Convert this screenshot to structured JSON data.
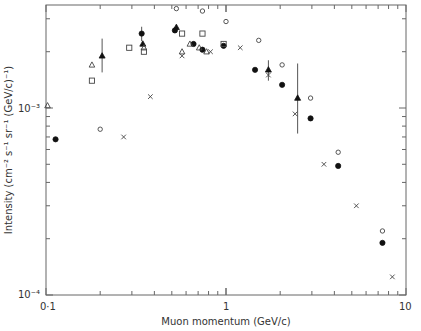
{
  "chart_data": {
    "type": "scatter",
    "title": "",
    "xlabel": "Muon momentum (GeV/c)",
    "ylabel": "Intensity (cm⁻² s⁻¹ sr⁻¹ (GeV/c)⁻¹)",
    "xscale": "log",
    "yscale": "log",
    "xlim": [
      0.1,
      10
    ],
    "ylim": [
      0.0001,
      0.0035
    ],
    "x_tick_labels": [
      "0·1",
      "1",
      "10"
    ],
    "y_tick_labels": [
      "10⁻⁴",
      "10⁻³"
    ],
    "grid": false,
    "legend": null,
    "series": [
      {
        "name": "filled-circle",
        "marker": "filled-circle",
        "points": [
          {
            "x": 0.113,
            "y": 0.00068
          },
          {
            "x": 0.34,
            "y": 0.0025,
            "err": [
              0.00022,
              0.00022
            ]
          },
          {
            "x": 0.52,
            "y": 0.0026
          },
          {
            "x": 0.66,
            "y": 0.0022
          },
          {
            "x": 0.74,
            "y": 0.00205
          },
          {
            "x": 0.97,
            "y": 0.00215
          },
          {
            "x": 1.45,
            "y": 0.0016
          },
          {
            "x": 2.05,
            "y": 0.00133
          },
          {
            "x": 2.95,
            "y": 0.00088
          },
          {
            "x": 4.2,
            "y": 0.00049
          },
          {
            "x": 7.4,
            "y": 0.00019
          }
        ]
      },
      {
        "name": "filled-triangle",
        "marker": "filled-triangle",
        "points": [
          {
            "x": 0.205,
            "y": 0.0019,
            "err": [
              0.00035,
              0.00045
            ]
          },
          {
            "x": 0.345,
            "y": 0.0022
          },
          {
            "x": 0.53,
            "y": 0.0027
          },
          {
            "x": 1.72,
            "y": 0.0016,
            "err": [
              0.0002,
              0.0002
            ]
          },
          {
            "x": 2.5,
            "y": 0.00113,
            "err": [
              0.0004,
              0.0006
            ]
          }
        ]
      },
      {
        "name": "open-circle",
        "marker": "open-circle",
        "points": [
          {
            "x": 0.2,
            "y": 0.00077
          },
          {
            "x": 0.53,
            "y": 0.0034
          },
          {
            "x": 0.74,
            "y": 0.0033
          },
          {
            "x": 1.0,
            "y": 0.0029
          },
          {
            "x": 1.52,
            "y": 0.0023
          },
          {
            "x": 2.05,
            "y": 0.0017
          },
          {
            "x": 2.95,
            "y": 0.00113
          },
          {
            "x": 4.2,
            "y": 0.00058
          },
          {
            "x": 7.4,
            "y": 0.00022
          }
        ]
      },
      {
        "name": "open-square",
        "marker": "open-square",
        "points": [
          {
            "x": 0.18,
            "y": 0.0014
          },
          {
            "x": 0.29,
            "y": 0.0021
          },
          {
            "x": 0.35,
            "y": 0.002
          },
          {
            "x": 0.57,
            "y": 0.0025
          },
          {
            "x": 0.74,
            "y": 0.0025
          },
          {
            "x": 0.97,
            "y": 0.0022
          }
        ]
      },
      {
        "name": "open-triangle",
        "marker": "open-triangle",
        "points": [
          {
            "x": 0.102,
            "y": 0.00103
          },
          {
            "x": 0.18,
            "y": 0.0017
          },
          {
            "x": 0.35,
            "y": 0.0021
          },
          {
            "x": 0.57,
            "y": 0.002
          },
          {
            "x": 0.63,
            "y": 0.0022
          },
          {
            "x": 0.71,
            "y": 0.0021
          },
          {
            "x": 0.78,
            "y": 0.002
          }
        ]
      },
      {
        "name": "cross",
        "marker": "cross",
        "points": [
          {
            "x": 0.27,
            "y": 0.0007
          },
          {
            "x": 0.38,
            "y": 0.00115
          },
          {
            "x": 0.57,
            "y": 0.0019
          },
          {
            "x": 0.82,
            "y": 0.002
          },
          {
            "x": 1.2,
            "y": 0.0021
          },
          {
            "x": 1.72,
            "y": 0.0015
          },
          {
            "x": 2.42,
            "y": 0.00093
          },
          {
            "x": 3.5,
            "y": 0.0005
          },
          {
            "x": 5.3,
            "y": 0.0003
          },
          {
            "x": 8.4,
            "y": 0.000125
          }
        ]
      }
    ]
  },
  "layout": {
    "plot_left": 46,
    "plot_right": 406,
    "plot_top": 5,
    "plot_bottom": 295
  }
}
